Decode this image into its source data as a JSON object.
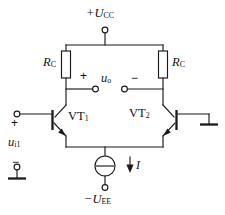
{
  "figure": {
    "name": "differential-amplifier-circuit",
    "stroke_color": "#1a1a1a",
    "background_color": "#ffffff"
  },
  "labels": {
    "supply_positive": "+U",
    "supply_positive_sub": "CC",
    "supply_negative": "−U",
    "supply_negative_sub": "EE",
    "resistor_left": "R",
    "resistor_left_sub": "C",
    "resistor_right": "R",
    "resistor_right_sub": "C",
    "transistor_left": "VT",
    "transistor_left_sub": "1",
    "transistor_right": "VT",
    "transistor_right_sub": "2",
    "output_voltage": "u",
    "output_voltage_sub": "o",
    "output_plus": "+",
    "output_minus": "−",
    "input_voltage": "u",
    "input_voltage_sub": "i1",
    "input_plus": "+",
    "input_minus": "−",
    "current_source": "I"
  },
  "nodes": [
    {
      "name": "vcc-terminal",
      "x": 105,
      "y": 29
    },
    {
      "name": "vee-terminal",
      "x": 105,
      "y": 188
    },
    {
      "name": "output-plus-terminal",
      "x": 96,
      "y": 89
    },
    {
      "name": "output-minus-terminal",
      "x": 124,
      "y": 89
    },
    {
      "name": "input-plus-terminal",
      "x": 17,
      "y": 114
    },
    {
      "name": "input-minus-terminal",
      "x": 17,
      "y": 167
    }
  ],
  "icons": {
    "ground_right": "ground-icon",
    "ground_input": "ground-icon",
    "current_source": "current-source-icon",
    "current_arrow": "arrow-down-icon"
  }
}
